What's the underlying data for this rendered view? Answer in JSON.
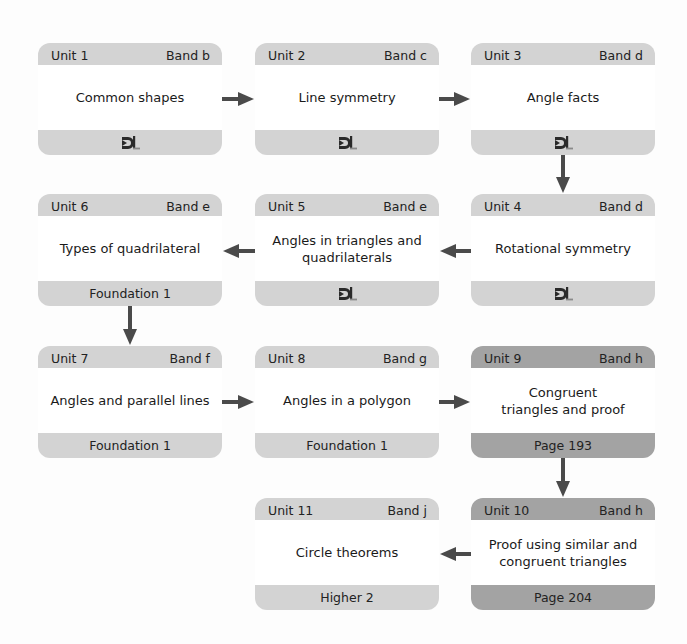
{
  "diagram": {
    "type": "unit-flowchart",
    "colors": {
      "light_box": "#d3d3d3",
      "dark_box": "#a3a3a3",
      "body": "#ffffff",
      "arrow": "#4a4a4a"
    },
    "units": [
      {
        "unit": "Unit 1",
        "band": "Band b",
        "title": "Common shapes",
        "footer": "",
        "footer_icon": "dl-logo-icon",
        "style": "light"
      },
      {
        "unit": "Unit 2",
        "band": "Band c",
        "title": "Line symmetry",
        "footer": "",
        "footer_icon": "dl-logo-icon",
        "style": "light"
      },
      {
        "unit": "Unit 3",
        "band": "Band d",
        "title": "Angle facts",
        "footer": "",
        "footer_icon": "dl-logo-icon",
        "style": "light"
      },
      {
        "unit": "Unit 4",
        "band": "Band d",
        "title": "Rotational symmetry",
        "footer": "",
        "footer_icon": "dl-logo-icon",
        "style": "light"
      },
      {
        "unit": "Unit 5",
        "band": "Band e",
        "title": "Angles in triangles and quadrilaterals",
        "footer": "",
        "footer_icon": "dl-logo-icon",
        "style": "light"
      },
      {
        "unit": "Unit 6",
        "band": "Band e",
        "title": "Types of quadrilateral",
        "footer": "Foundation 1",
        "footer_icon": "",
        "style": "light"
      },
      {
        "unit": "Unit 7",
        "band": "Band f",
        "title": "Angles and parallel lines",
        "footer": "Foundation 1",
        "footer_icon": "",
        "style": "light"
      },
      {
        "unit": "Unit 8",
        "band": "Band g",
        "title": "Angles in a polygon",
        "footer": "Foundation 1",
        "footer_icon": "",
        "style": "light"
      },
      {
        "unit": "Unit 9",
        "band": "Band h",
        "title": "Congruent triangles and proof",
        "footer": "Page 193",
        "footer_icon": "",
        "style": "dark"
      },
      {
        "unit": "Unit 10",
        "band": "Band h",
        "title": "Proof using similar and congruent triangles",
        "footer": "Page 204",
        "footer_icon": "",
        "style": "dark"
      },
      {
        "unit": "Unit 11",
        "band": "Band j",
        "title": "Circle theorems",
        "footer": "Higher 2",
        "footer_icon": "",
        "style": "light"
      }
    ],
    "flow": [
      {
        "from": "Unit 1",
        "to": "Unit 2",
        "direction": "right"
      },
      {
        "from": "Unit 2",
        "to": "Unit 3",
        "direction": "right"
      },
      {
        "from": "Unit 3",
        "to": "Unit 4",
        "direction": "down"
      },
      {
        "from": "Unit 4",
        "to": "Unit 5",
        "direction": "left"
      },
      {
        "from": "Unit 5",
        "to": "Unit 6",
        "direction": "left"
      },
      {
        "from": "Unit 6",
        "to": "Unit 7",
        "direction": "down"
      },
      {
        "from": "Unit 7",
        "to": "Unit 8",
        "direction": "right"
      },
      {
        "from": "Unit 8",
        "to": "Unit 9",
        "direction": "right"
      },
      {
        "from": "Unit 9",
        "to": "Unit 10",
        "direction": "down"
      },
      {
        "from": "Unit 10",
        "to": "Unit 11",
        "direction": "left"
      }
    ]
  }
}
